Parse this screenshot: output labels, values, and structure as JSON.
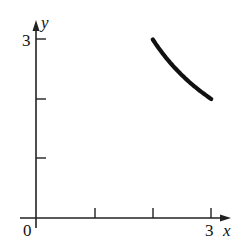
{
  "chart_data": {
    "type": "line",
    "title": "",
    "xlabel": "x",
    "ylabel": "y",
    "xlim": [
      0,
      3
    ],
    "ylim": [
      0,
      3
    ],
    "x_ticks": [
      1,
      2,
      3
    ],
    "y_ticks": [
      1,
      2,
      3
    ],
    "x_tick_labels": {
      "origin": "0",
      "end": "3"
    },
    "y_tick_labels": {
      "end": "3"
    },
    "grid": false,
    "legend": null,
    "series": [
      {
        "name": "curve",
        "description": "decreasing concave-up curve from (2,3) to (3,2), consistent with y = 6/x",
        "x": [
          2.0,
          2.2,
          2.4,
          2.6,
          2.8,
          3.0
        ],
        "y": [
          3.0,
          2.73,
          2.5,
          2.31,
          2.14,
          2.0
        ]
      }
    ]
  },
  "labels": {
    "origin": "0",
    "x_axis_name": "x",
    "y_axis_name": "y",
    "x_max": "3",
    "y_max": "3"
  },
  "colors": {
    "axis": "#222222",
    "curve": "#111111",
    "background": "#ffffff"
  }
}
